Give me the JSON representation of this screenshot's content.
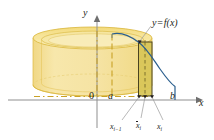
{
  "figure": {
    "axes": {
      "y_label": "y",
      "x_label": "x",
      "origin_label": "0",
      "a_label": "a",
      "b_label": "b"
    },
    "annotations": {
      "curve_label_y": "y",
      "curve_label_eq": "=",
      "curve_label_f": "f",
      "curve_label_arg": "(x)",
      "x_left_base": "x",
      "x_left_sub": "i−1",
      "x_mid_base": "x",
      "x_mid_sub": "i",
      "x_right_base": "x",
      "x_right_sub": "i"
    },
    "colors": {
      "shell_fill": "#f7e08a",
      "shell_fill_dark": "#e8c84f",
      "shell_stroke": "#d9b93c",
      "strip_fill": "#ddcc63",
      "strip_stroke": "#4a4320",
      "curve_stroke": "#2b5f8e",
      "axis_stroke": "#8a8a8a",
      "dash_stroke": "#c9a227",
      "leader_stroke": "#9a9a9a",
      "text": "#231f20"
    },
    "geometry": {
      "axis_y_x": 97,
      "axis_x_y": 100,
      "a_x": 112,
      "b_x": 175,
      "xi_minus_1_x": 139,
      "xbar_i_x": 145,
      "xi_x": 152,
      "cyl_left_x": 33,
      "cyl_right_x": 152,
      "cyl_top_y": 38,
      "cyl_bottom_y": 96,
      "ellipse_ry": 11
    }
  }
}
